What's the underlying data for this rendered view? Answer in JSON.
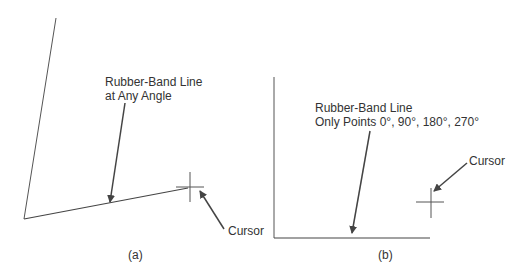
{
  "panel_a": {
    "label_line1": "Rubber-Band Line",
    "label_line2": "at Any Angle",
    "cursor_label": "Cursor",
    "caption": "(a)"
  },
  "panel_b": {
    "label_line1": "Rubber-Band Line",
    "label_line2": "Only Points 0°, 90°, 180°, 270°",
    "cursor_label": "Cursor",
    "caption": "(b)"
  }
}
